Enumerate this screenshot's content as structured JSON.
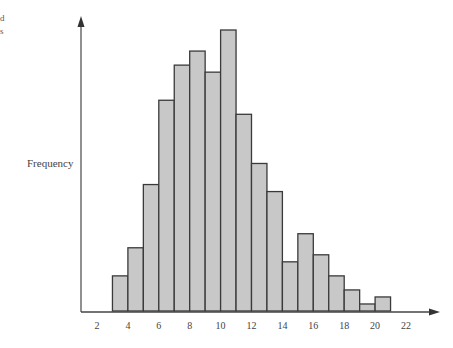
{
  "clipped_fragments": [
    "d",
    "s"
  ],
  "chart_data": {
    "type": "bar",
    "title": "",
    "xlabel": "",
    "ylabel": "Frequency",
    "bin_edges": [
      3,
      4,
      5,
      6,
      7,
      8,
      9,
      10,
      11,
      12,
      13,
      14,
      15,
      16,
      17,
      18,
      19,
      20,
      21
    ],
    "values": [
      5,
      9,
      18,
      30,
      35,
      37,
      34,
      40,
      28,
      21,
      17,
      7,
      11,
      8,
      5,
      3,
      1,
      2
    ],
    "x_ticks": [
      2,
      4,
      6,
      8,
      10,
      12,
      14,
      16,
      18,
      20,
      22
    ],
    "xlim": [
      2,
      22
    ],
    "ylim": [
      0,
      40
    ],
    "grid": false,
    "legend": null,
    "colors": {
      "bar_fill": "#c8c8c8",
      "bar_edge": "#3a3a3a",
      "axis": "#555555"
    }
  }
}
